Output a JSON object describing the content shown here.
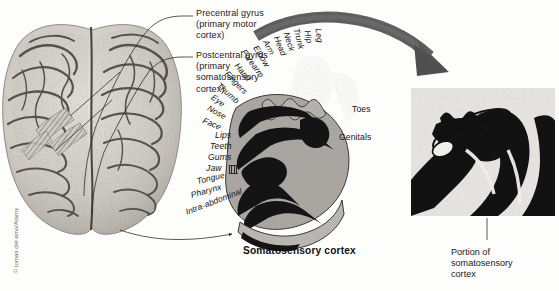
{
  "figure": {
    "title": "Somatosensory cortex",
    "inset_caption": "Portion of\nsomatosensory\ncortex",
    "credit": "© tomas del amo/Alamy"
  },
  "callouts": [
    {
      "id": "precentral",
      "text": "Precentral gyrus\n(primary motor\ncortex)"
    },
    {
      "id": "postcentral",
      "text": "Postcentral gyrus\n(primary\nsomatosensory\ncortex)"
    }
  ],
  "homunculus_labels": {
    "upper_arc": [
      "Leg",
      "Hip",
      "Trunk",
      "Neck",
      "Head",
      "Arm",
      "Elbow",
      "Forearm",
      "Hand",
      "Fingers",
      "Thumb",
      "Eye",
      "Nose",
      "Face"
    ],
    "lower_stack": [
      "Lips",
      "Teeth",
      "Gums",
      "Jaw",
      "Tongue",
      "Pharynx",
      "Intra-abdominal"
    ],
    "right_side": [
      "Toes",
      "Genitals"
    ]
  },
  "inset": {
    "numbers": [
      "1",
      "2",
      "3",
      "4",
      "5"
    ]
  },
  "colors": {
    "arrow": "#5e5e5e",
    "cortex_gray": "#a9a6a1",
    "cortex_dark": "#141414",
    "panel_bg": "#e8e6e2",
    "page_bg": "#fdfdfb",
    "text": "#1a1a1a"
  }
}
